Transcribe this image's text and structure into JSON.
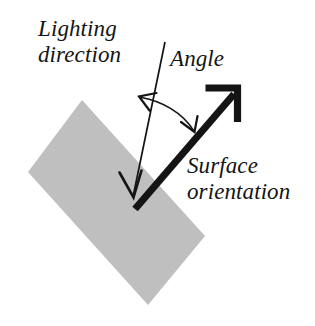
{
  "diagram": {
    "background_color": "#ffffff",
    "ink_color": "#141414",
    "surface_fill_color": "#bfbfbf",
    "labels": {
      "lighting_direction_line1": "Lighting",
      "lighting_direction_line2": "direction",
      "angle": "Angle",
      "surface_orientation_line1": "Surface",
      "surface_orientation_line2": "orientation"
    },
    "elements": {
      "surface_patch": {
        "name": "surface-patch",
        "shape": "rotated-rectangle",
        "fill": "#bfbfbf",
        "corners": [
          [
            82,
            100
          ],
          [
            205,
            236
          ],
          [
            148,
            305
          ],
          [
            28,
            172
          ]
        ]
      },
      "lighting_ray": {
        "name": "lighting-direction-arrow",
        "stroke": "#141414",
        "stroke_width": 1.6,
        "from": [
          165,
          42
        ],
        "to": [
          132,
          196
        ],
        "arrowhead": "open-v-at-end"
      },
      "surface_normal": {
        "name": "surface-orientation-arrow",
        "stroke": "#141414",
        "stroke_width": 7,
        "from": [
          135,
          208
        ],
        "to": [
          236,
          92
        ],
        "arrowhead": "open-v-bold-at-end"
      },
      "angle_arc": {
        "name": "angle-arc",
        "stroke": "#141414",
        "stroke_width": 1.6,
        "double_headed": true,
        "from": [
          140,
          98
        ],
        "to": [
          194,
          130
        ]
      }
    }
  }
}
